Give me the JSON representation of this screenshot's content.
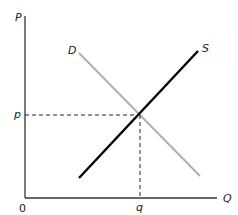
{
  "diagram": {
    "type": "supply-demand",
    "axes": {
      "y_label": "P",
      "x_label": "Q",
      "origin_label": "0"
    },
    "curves": {
      "supply": {
        "label": "S",
        "color": "#000000"
      },
      "demand": {
        "label": "D",
        "color": "#b0b0b0"
      }
    },
    "equilibrium": {
      "price_label": "p",
      "quantity_label": "q"
    },
    "colors": {
      "axis": "#333333",
      "guide": "#222222"
    }
  }
}
